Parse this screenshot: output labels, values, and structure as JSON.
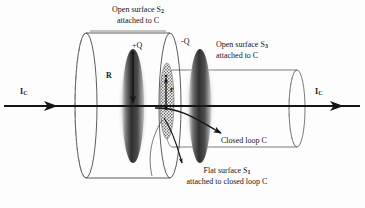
{
  "figure": {
    "type": "diagram",
    "background_color": "#fdfdfd",
    "ink_color": "#151515",
    "plate_color": "#3a3a3a"
  },
  "labels": {
    "open_surface_s2_line1": "Open surface S",
    "open_surface_s2_sub": "2",
    "open_surface_s2_line2": "attached to C",
    "open_surface_s3_line1": "Open surface S",
    "open_surface_s3_sub": "3",
    "open_surface_s3_line2": "attached to C",
    "flat_surface_s1_line1": "Flat surface S",
    "flat_surface_s1_sub": "1",
    "flat_surface_s1_line2": "attached to closed loop C",
    "closed_loop": "Closed loop C",
    "charge_positive": "+Q",
    "charge_negative": "-Q",
    "radius_big": "R",
    "radius_small": "r",
    "current_left": "I",
    "current_left_sub": "C",
    "current_right": "I",
    "current_right_sub": "C"
  },
  "geometry": {
    "axis_y": 106,
    "axis_x_start": 4,
    "axis_x_end": 360,
    "cylinder_s2": {
      "left_x": 86,
      "right_x": 170,
      "top_y": 33,
      "bottom_y": 178,
      "cap_rx": 11
    },
    "cylinder_s3": {
      "left_x": 172,
      "right_x": 297,
      "top_y": 70,
      "bottom_y": 147,
      "cap_rx": 8
    },
    "plate_positive": {
      "cx": 133,
      "cy": 106,
      "rx": 11,
      "ry": 57
    },
    "plate_negative": {
      "cx": 200,
      "cy": 106,
      "rx": 11,
      "ry": 57
    },
    "flat_surface_s1": {
      "cx": 167,
      "cy": 101,
      "rx": 7,
      "ry": 38
    }
  }
}
